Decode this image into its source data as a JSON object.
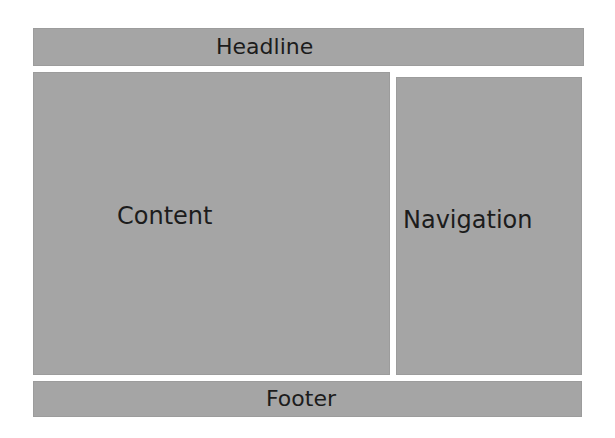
{
  "diagram": {
    "type": "page-layout-wireframe",
    "fill_color": "#a5a5a5",
    "text_color": "#1c1c1c",
    "regions": {
      "headline": {
        "label": "Headline"
      },
      "content": {
        "label": "Content"
      },
      "navigation": {
        "label": "Navigation"
      },
      "footer": {
        "label": "Footer"
      }
    }
  }
}
